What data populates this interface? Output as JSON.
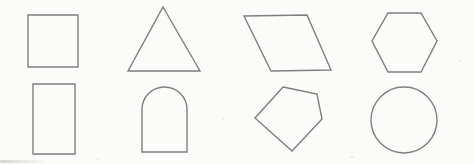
{
  "canvas": {
    "width": 474,
    "height": 164,
    "background_color": "#fbfbf9",
    "stroke_color": "#7f7f7f",
    "stroke_width": 1.4
  },
  "shapes": [
    {
      "name": "square",
      "row": 1,
      "col": 1,
      "type": "polygon",
      "points": [
        [
          28,
          15
        ],
        [
          78,
          15
        ],
        [
          78,
          67
        ],
        [
          28,
          67
        ]
      ]
    },
    {
      "name": "triangle",
      "row": 1,
      "col": 2,
      "type": "polygon",
      "points": [
        [
          163,
          7
        ],
        [
          200,
          71
        ],
        [
          128,
          71
        ]
      ]
    },
    {
      "name": "parallelogram",
      "row": 1,
      "col": 3,
      "type": "polygon",
      "points": [
        [
          244,
          16
        ],
        [
          307,
          15
        ],
        [
          331,
          70
        ],
        [
          271,
          71
        ]
      ]
    },
    {
      "name": "hexagon",
      "row": 1,
      "col": 4,
      "type": "polygon",
      "points": [
        [
          388,
          13
        ],
        [
          421,
          13
        ],
        [
          437,
          41
        ],
        [
          421,
          72
        ],
        [
          388,
          72
        ],
        [
          372,
          41
        ]
      ]
    },
    {
      "name": "rectangle",
      "row": 2,
      "col": 1,
      "type": "polygon",
      "points": [
        [
          33,
          84
        ],
        [
          75,
          84
        ],
        [
          75,
          154
        ],
        [
          33,
          154
        ]
      ]
    },
    {
      "name": "arch",
      "row": 2,
      "col": 2,
      "type": "path",
      "d": "M 142 152 L 142 109.5 A 22.5 22.5 0 0 1 187 109.5 L 187 152 Z"
    },
    {
      "name": "pentagon",
      "row": 2,
      "col": 3,
      "type": "polygon",
      "points": [
        [
          283,
          87
        ],
        [
          317,
          94
        ],
        [
          322,
          119
        ],
        [
          292,
          151
        ],
        [
          255,
          118
        ]
      ]
    },
    {
      "name": "circle",
      "row": 2,
      "col": 4,
      "type": "circle",
      "cx": 404,
      "cy": 120,
      "r": 33
    }
  ]
}
